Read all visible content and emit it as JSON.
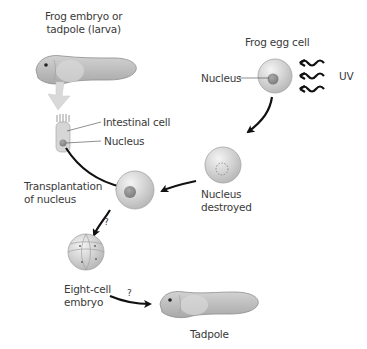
{
  "diagram": {
    "labels": {
      "source": "Frog embryo or\ntadpole (larva)",
      "egg": "Frog egg cell",
      "egg_nucleus": "Nucleus",
      "uv": "UV",
      "intestinal_cell": "Intestinal cell",
      "intestinal_nucleus": "Nucleus",
      "transplant": "Transplantation\nof nucleus",
      "destroyed": "Nucleus\ndestroyed",
      "eight_cell": "Eight-cell\nembryo",
      "tadpole": "Tadpole",
      "q1": "?",
      "q2": "?"
    },
    "colors": {
      "cell_fill": "#cfcfcf",
      "cell_highlight": "#f2f2f2",
      "nucleus": "#8c8c8c",
      "tadpole": "#b9b9b9",
      "arrow": "#111111",
      "big_arrow": "#d9d9d9",
      "text": "#3a3a3a"
    },
    "steps": [
      {
        "from": "intestinal_cell",
        "to": "recipient_egg",
        "label": "Transplantation of nucleus"
      },
      {
        "from": "egg_cell",
        "to": "enucleated_egg",
        "label": "UV"
      },
      {
        "from": "enucleated_egg",
        "to": "recipient_egg",
        "label": ""
      },
      {
        "from": "recipient_egg",
        "to": "eight_cell_embryo",
        "label": "?"
      },
      {
        "from": "eight_cell_embryo",
        "to": "tadpole",
        "label": "?"
      }
    ]
  }
}
